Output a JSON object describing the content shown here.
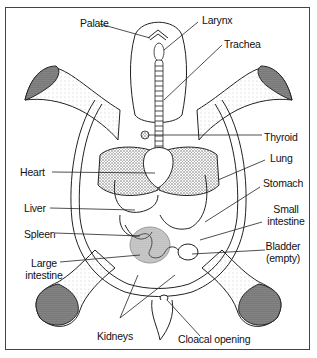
{
  "diagram": {
    "labels": {
      "palate": "Palate",
      "larynx": "Larynx",
      "trachea": "Trachea",
      "thyroid": "Thyroid",
      "heart": "Heart",
      "lung": "Lung",
      "stomach": "Stomach",
      "liver": "Liver",
      "small_intestine_1": "Small",
      "small_intestine_2": "intestine",
      "spleen": "Spleen",
      "bladder_1": "Bladder",
      "bladder_2": "(empty)",
      "large_intestine_1": "Large",
      "large_intestine_2": "intestine",
      "kidneys": "Kidneys",
      "cloacal_opening": "Cloacal opening"
    },
    "colors": {
      "line": "#222222",
      "stipple": "#555555",
      "background": "#ffffff"
    }
  }
}
